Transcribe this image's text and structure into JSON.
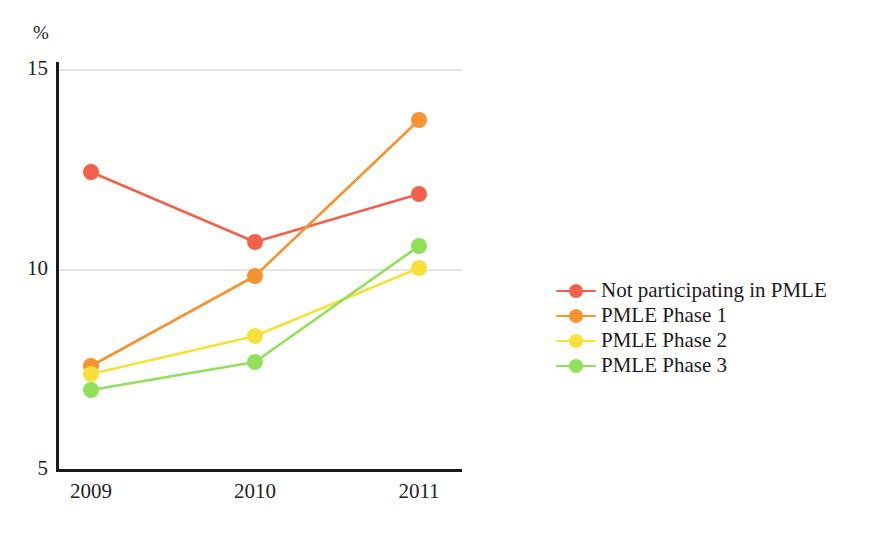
{
  "chart_data": {
    "type": "line",
    "title": "",
    "xlabel": "",
    "ylabel": "%",
    "categories": [
      "2009",
      "2010",
      "2011"
    ],
    "x": [
      2009,
      2010,
      2011
    ],
    "ylim": [
      5,
      15
    ],
    "yticks": [
      5,
      10,
      15
    ],
    "ytick_labels": [
      "5",
      "10",
      "15"
    ],
    "grid": "horizontal",
    "legend_position": "right",
    "series": [
      {
        "name": "Not participating in PMLE",
        "color": "#f4614a",
        "values": [
          12.45,
          10.7,
          11.9
        ]
      },
      {
        "name": "PMLE Phase 1",
        "color": "#f59331",
        "values": [
          7.6,
          9.85,
          13.75
        ]
      },
      {
        "name": "PMLE Phase 2",
        "color": "#f7e03a",
        "values": [
          7.4,
          8.35,
          10.05
        ]
      },
      {
        "name": "PMLE Phase 3",
        "color": "#92e05a",
        "values": [
          7.0,
          7.7,
          10.6
        ]
      }
    ]
  },
  "axes": {
    "unit_label": "%",
    "axis_color": "#1b1b1b",
    "grid_color": "#c9c9c9"
  }
}
